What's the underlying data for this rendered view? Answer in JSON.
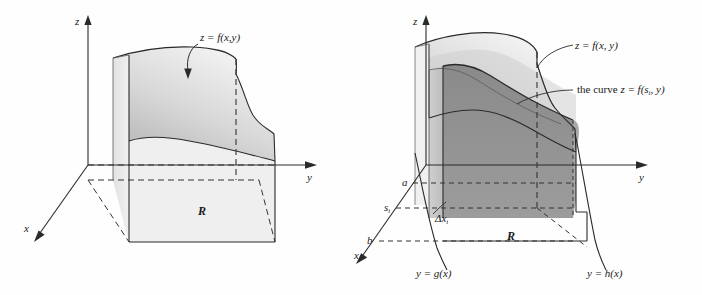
{
  "figure": {
    "domain": "math-diagram",
    "background_color": "#fefefe",
    "ink_color": "#1a1a1a"
  },
  "panels": [
    {
      "id": "left",
      "axes": {
        "x": "x",
        "y": "y",
        "z": "z"
      },
      "surface_label": "z = f(x,y)",
      "region_label": "R",
      "fills": {
        "surface_top": "#dcdcdc",
        "side_wall": "#e9e9e9",
        "base_region": "#ececec"
      }
    },
    {
      "id": "right",
      "axes": {
        "x": "x",
        "y": "y",
        "z": "z"
      },
      "surface_label": "z = f(x, y)",
      "curve_label_prefix": "the curve ",
      "curve_label_eq": "z = f(s",
      "curve_label_sub": "i",
      "curve_label_tail": ", y)",
      "region_label": "R",
      "marks": {
        "a": "a",
        "b": "b",
        "s_main": "s",
        "s_sub": "i",
        "delta_main": "Δx",
        "delta_sub": "i"
      },
      "boundary_left": "y = g(x)",
      "boundary_right": "y = h(x)",
      "fills": {
        "surface_top": "#d9d9d9",
        "slab_front": "#8e8e8e",
        "slab_side": "#c4c4c4",
        "back_wall": "#efefef",
        "base_region": "#ffffff"
      }
    }
  ]
}
